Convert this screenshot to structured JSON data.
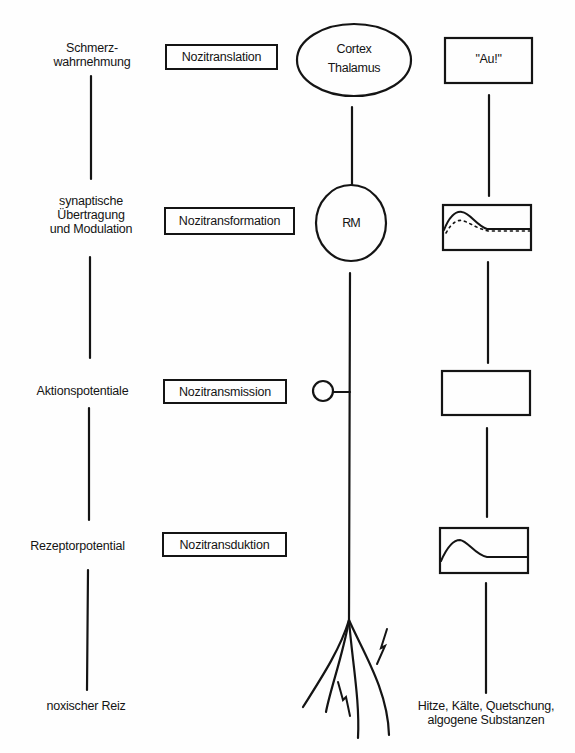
{
  "diagram": {
    "levels": [
      {
        "name": "perception",
        "left_label": [
          "Schmerz-",
          "wahrnehmung"
        ],
        "process": "Nozitranslation",
        "center_node": [
          "Cortex",
          "Thalamus"
        ],
        "right_box": "\"Au!\""
      },
      {
        "name": "synaptic",
        "left_label": [
          "synaptische",
          "Übertragung",
          "und Modulation"
        ],
        "process": "Nozitransformation",
        "center_node": [
          "RM"
        ],
        "right_box": "graph-potential-with-modulation"
      },
      {
        "name": "action-potentials",
        "left_label": [
          "Aktionspotentiale"
        ],
        "process": "Nozitransmission",
        "center_node": [],
        "right_box": "blank"
      },
      {
        "name": "receptor",
        "left_label": [
          "Rezeptorpotential"
        ],
        "process": "Nozitransduktion",
        "center_node": [],
        "right_box": "graph-receptor-potential"
      },
      {
        "name": "stimulus",
        "left_label": [
          "noxischer Reiz"
        ],
        "process": "",
        "center_node": [],
        "right_label": [
          "Hitze, Kälte, Quetschung,",
          "algogene Substanzen"
        ]
      }
    ],
    "colors": {
      "ink": "#141414",
      "paper": "#fefefe"
    }
  }
}
